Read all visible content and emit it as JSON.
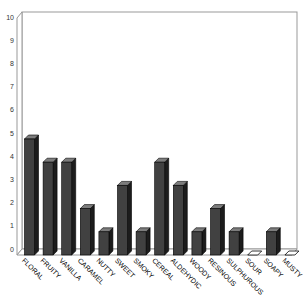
{
  "chart_data": {
    "type": "bar",
    "variant": "3d-column",
    "title": "",
    "xlabel": "",
    "ylabel": "",
    "categories": [
      "FLORAL",
      "FRUITY",
      "VANILLA",
      "CARAMEL",
      "NUTTY",
      "SWEET",
      "SMOKY",
      "CEREAL",
      "ALDEHYDIC",
      "WOODY",
      "RESINOUS",
      "SULPHUROUS",
      "SOUR",
      "SOAPY",
      "MUSTY"
    ],
    "values": [
      5,
      4,
      4,
      2,
      1,
      3,
      1,
      4,
      3,
      1,
      2,
      1,
      0,
      1,
      0
    ],
    "ylim": [
      0,
      10
    ],
    "yticks": [
      0,
      1,
      2,
      3,
      4,
      5,
      6,
      7,
      8,
      9,
      10
    ],
    "grid": false,
    "legend": false,
    "colors": {
      "bar_front": "#414141",
      "bar_side": "#1c1c1c",
      "bar_top": "#7d7d7d",
      "zero_marker_fill": "#ffffff",
      "outline": "#000000",
      "wall_stroke": "#999999",
      "background": "#ffffff",
      "tick_label": "#333333",
      "category_label": "#000000"
    }
  }
}
